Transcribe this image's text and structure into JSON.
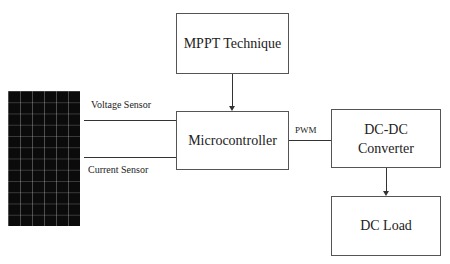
{
  "diagram": {
    "solar_panel": {
      "label": ""
    },
    "boxes": {
      "mppt": "MPPT Technique",
      "microcontroller": "Microcontroller",
      "converter_line1": "DC-DC",
      "converter_line2": "Converter",
      "load": "DC Load"
    },
    "edge_labels": {
      "voltage": "Voltage Sensor",
      "current": "Current Sensor",
      "pwm": "PWM"
    },
    "connections": [
      {
        "from": "solar_panel",
        "to": "microcontroller",
        "label": "Voltage Sensor"
      },
      {
        "from": "solar_panel",
        "to": "microcontroller",
        "label": "Current Sensor"
      },
      {
        "from": "mppt",
        "to": "microcontroller",
        "arrow": true
      },
      {
        "from": "microcontroller",
        "to": "dc_dc_converter",
        "label": "PWM"
      },
      {
        "from": "dc_dc_converter",
        "to": "dc_load",
        "arrow": true
      }
    ]
  }
}
